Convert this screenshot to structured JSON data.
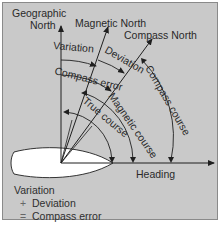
{
  "diagram": {
    "colors": {
      "background": "#c9c9c9",
      "line": "#1f1f1f",
      "hull": "#ffffff",
      "text": "#2a2a2a"
    },
    "labels": {
      "geographic_north_1": "Geographic",
      "geographic_north_2": "North",
      "magnetic_north": "Magnetic North",
      "compass_north": "Compass North",
      "variation": "Variation",
      "deviation": "Deviation",
      "compass_error": "Compass error",
      "true_course": "True course",
      "magnetic_course": "Magnetic course",
      "compass_course": "Compass course",
      "heading": "Heading"
    },
    "legend": {
      "line1": "Variation",
      "line2_op": "+",
      "line2": "Deviation",
      "line3_op": "=",
      "line3": "Compass error"
    }
  }
}
